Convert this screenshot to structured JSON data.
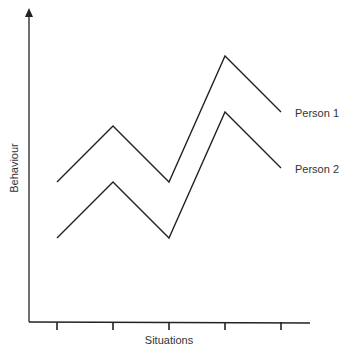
{
  "chart_data": {
    "type": "line",
    "title": "",
    "xlabel": "Situations",
    "ylabel": "Behaviour",
    "x": [
      1,
      2,
      3,
      4,
      5
    ],
    "categories": [
      "",
      "",
      "",
      "",
      ""
    ],
    "series": [
      {
        "name": "Person 1",
        "values": [
          4.5,
          6.5,
          4.5,
          9.0,
          7.0
        ]
      },
      {
        "name": "Person 2",
        "values": [
          2.5,
          4.5,
          2.5,
          7.0,
          5.0
        ]
      }
    ],
    "ylim": [
      -0.5,
      11
    ],
    "grid": false,
    "legend_position": "inline-right",
    "line_color": "#222222"
  }
}
